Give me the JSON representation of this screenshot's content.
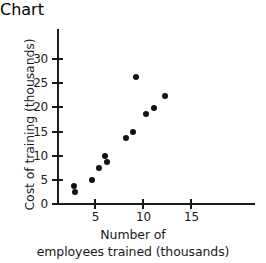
{
  "chart_data": {
    "type": "scatter",
    "title": "",
    "xlabel": "Number of employees trained (thousands)",
    "xlabel_line1": "Number of",
    "xlabel_line2": "employees trained (thousands)",
    "ylabel": "Cost of training (thousands)",
    "xlim": [
      2,
      18.5
    ],
    "ylim": [
      0,
      34
    ],
    "grid": false,
    "legend": null,
    "marker": "filled-circle",
    "marker_color": "#111111",
    "axis_color": "#1a1a1a",
    "xticks": [
      5,
      10,
      15
    ],
    "xtick_labels": [
      "5",
      "10",
      "15"
    ],
    "yticks": [
      0,
      5,
      10,
      15,
      20,
      25,
      30
    ],
    "ytick_labels": [
      "0",
      "5",
      "10",
      "15",
      "20",
      "25",
      "30"
    ],
    "x": [
      2.8,
      2.9,
      3.5,
      4.6,
      5.4,
      6.0,
      6.2,
      8.2,
      8.9,
      9.2,
      10.0,
      10.5,
      11.3,
      12.3
    ],
    "y": [
      3.8,
      2.4,
      2.6,
      5.0,
      7.4,
      10.0,
      8.7,
      13.7,
      15.0,
      26.2,
      18.7,
      18.6,
      19.9,
      22.4
    ],
    "points": [
      {
        "x": 2.8,
        "y": 3.8
      },
      {
        "x": 2.9,
        "y": 2.4
      },
      {
        "x": 4.6,
        "y": 5.0
      },
      {
        "x": 5.4,
        "y": 7.4
      },
      {
        "x": 6.0,
        "y": 10.0
      },
      {
        "x": 6.2,
        "y": 8.7
      },
      {
        "x": 8.2,
        "y": 13.7
      },
      {
        "x": 8.9,
        "y": 15.0
      },
      {
        "x": 9.2,
        "y": 26.2
      },
      {
        "x": 10.3,
        "y": 18.7
      },
      {
        "x": 11.1,
        "y": 19.9
      },
      {
        "x": 12.2,
        "y": 22.4
      }
    ]
  }
}
